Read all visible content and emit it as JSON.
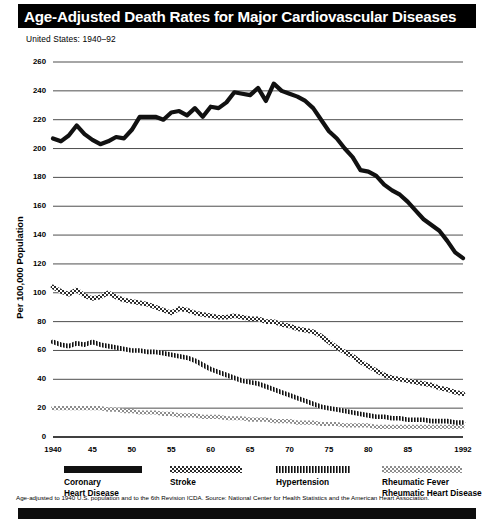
{
  "header": {
    "title": "Age-Adjusted Death Rates for Major Cardiovascular Diseases",
    "subtitle": "United States: 1940–92"
  },
  "footnote": "Age-adjusted to 1940 U.S. population and to the 6th Revision ICDA. Source: National Center for Health Statistics and the American Heart Association.",
  "legend": [
    {
      "label_line1": "Coronary",
      "label_line2": "Heart Disease",
      "pattern": "solid",
      "color": "#111111"
    },
    {
      "label_line1": "Stroke",
      "label_line2": "",
      "pattern": "checker",
      "color": "#333333"
    },
    {
      "label_line1": "Hypertension",
      "label_line2": "",
      "pattern": "vertical-bars",
      "color": "#1a1a1a"
    },
    {
      "label_line1": "Rheumatic Fever",
      "label_line2": "Rheumatic Heart Disease",
      "pattern": "light-checker",
      "color": "#8a8a8a"
    }
  ],
  "chart_data": {
    "type": "line",
    "title": "Age-Adjusted Death Rates for Major Cardiovascular Diseases",
    "subtitle": "United States: 1940–92",
    "xlabel": "",
    "ylabel": "Per 100,000 Population",
    "xlim": [
      1940,
      1992
    ],
    "ylim": [
      0,
      260
    ],
    "ytick_values": [
      0,
      20,
      40,
      60,
      80,
      100,
      120,
      140,
      160,
      180,
      200,
      220,
      240,
      260
    ],
    "ytick_labels": [
      "0",
      "20",
      "40",
      "60",
      "80",
      "100",
      "120",
      "140",
      "160",
      "180",
      "200",
      "220",
      "240",
      "260"
    ],
    "xtick_values": [
      1940,
      1945,
      1950,
      1955,
      1960,
      1965,
      1970,
      1975,
      1980,
      1985,
      1992
    ],
    "xtick_labels": [
      "1940",
      "45",
      "50",
      "55",
      "60",
      "65",
      "70",
      "75",
      "80",
      "85",
      "1992"
    ],
    "grid": "horizontal",
    "legend_position": "bottom",
    "x": [
      1940,
      1941,
      1942,
      1943,
      1944,
      1945,
      1946,
      1947,
      1948,
      1949,
      1950,
      1951,
      1952,
      1953,
      1954,
      1955,
      1956,
      1957,
      1958,
      1959,
      1960,
      1961,
      1962,
      1963,
      1964,
      1965,
      1966,
      1967,
      1968,
      1969,
      1970,
      1971,
      1972,
      1973,
      1974,
      1975,
      1976,
      1977,
      1978,
      1979,
      1980,
      1981,
      1982,
      1983,
      1984,
      1985,
      1986,
      1987,
      1988,
      1989,
      1990,
      1991,
      1992
    ],
    "series": [
      {
        "name": "Coronary Heart Disease",
        "pattern": "solid",
        "values": [
          207,
          205,
          209,
          216,
          210,
          206,
          203,
          205,
          208,
          207,
          213,
          222,
          222,
          222,
          220,
          225,
          226,
          223,
          228,
          222,
          229,
          228,
          232,
          239,
          238,
          237,
          242,
          233,
          245,
          240,
          238,
          236,
          233,
          228,
          220,
          212,
          207,
          200,
          194,
          185,
          184,
          181,
          175,
          171,
          168,
          163,
          157,
          151,
          147,
          143,
          136,
          128,
          124
        ]
      },
      {
        "name": "Stroke",
        "pattern": "checker",
        "values": [
          104,
          101,
          99,
          102,
          98,
          96,
          97,
          100,
          97,
          95,
          94,
          93,
          92,
          90,
          88,
          86,
          89,
          88,
          86,
          85,
          84,
          83,
          83,
          84,
          83,
          82,
          82,
          80,
          80,
          78,
          77,
          75,
          74,
          73,
          70,
          66,
          62,
          59,
          56,
          52,
          49,
          46,
          43,
          41,
          40,
          39,
          38,
          37,
          36,
          34,
          33,
          31,
          30
        ]
      },
      {
        "name": "Hypertension",
        "pattern": "vertical-bars",
        "values": [
          66,
          64,
          63,
          65,
          64,
          66,
          64,
          63,
          62,
          61,
          60,
          60,
          59,
          59,
          58,
          57,
          56,
          55,
          53,
          50,
          47,
          45,
          43,
          41,
          39,
          38,
          37,
          35,
          33,
          31,
          29,
          27,
          25,
          23,
          21,
          20,
          19,
          18,
          17,
          16,
          15,
          14,
          14,
          13,
          13,
          12,
          12,
          12,
          11,
          11,
          11,
          10,
          10
        ]
      },
      {
        "name": "Rheumatic Fever / Rheumatic Heart Disease",
        "pattern": "light-checker",
        "values": [
          20,
          20,
          20,
          20,
          20,
          20,
          20,
          19,
          19,
          18,
          18,
          17,
          17,
          17,
          16,
          16,
          15,
          15,
          15,
          14,
          14,
          14,
          13,
          13,
          13,
          12,
          12,
          12,
          11,
          11,
          11,
          10,
          10,
          10,
          9,
          9,
          9,
          8,
          8,
          8,
          8,
          7,
          7,
          7,
          7,
          7,
          7,
          7,
          7,
          7,
          7,
          7,
          7
        ]
      }
    ]
  }
}
